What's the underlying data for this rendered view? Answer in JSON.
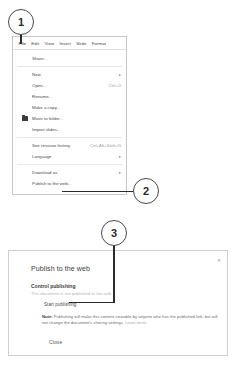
{
  "callouts": [
    {
      "number": "1",
      "target": "file-menu"
    },
    {
      "number": "2",
      "target": "publish-to-the-web-menu-item"
    },
    {
      "number": "3",
      "target": "start-publishing-button"
    }
  ],
  "menu_bar": {
    "items": [
      {
        "label": "File",
        "active": true
      },
      {
        "label": "Edit",
        "active": false
      },
      {
        "label": "View",
        "active": false
      },
      {
        "label": "Insert",
        "active": false
      },
      {
        "label": "Slide",
        "active": false
      },
      {
        "label": "Format",
        "active": false
      }
    ]
  },
  "file_menu": {
    "groups": [
      {
        "items": [
          {
            "label": "Share...",
            "shortcut": "",
            "arrow": "",
            "icon": ""
          }
        ]
      },
      {
        "items": [
          {
            "label": "New",
            "shortcut": "",
            "arrow": "▸",
            "icon": ""
          },
          {
            "label": "Open...",
            "shortcut": "Ctrl+O",
            "arrow": "",
            "icon": ""
          },
          {
            "label": "Rename...",
            "shortcut": "",
            "arrow": "",
            "icon": ""
          },
          {
            "label": "Make a copy...",
            "shortcut": "",
            "arrow": "",
            "icon": ""
          },
          {
            "label": "Move to folder...",
            "shortcut": "",
            "arrow": "",
            "icon": "folder-icon"
          },
          {
            "label": "Import slides...",
            "shortcut": "",
            "arrow": "",
            "icon": ""
          }
        ]
      },
      {
        "items": [
          {
            "label": "See revision history",
            "shortcut": "Ctrl+Alt+Shift+G",
            "arrow": "",
            "icon": ""
          },
          {
            "label": "Language",
            "shortcut": "",
            "arrow": "▸",
            "icon": ""
          }
        ]
      },
      {
        "items": [
          {
            "label": "Download as",
            "shortcut": "",
            "arrow": "▸",
            "icon": ""
          },
          {
            "label": "Publish to the web...",
            "shortcut": "",
            "arrow": "",
            "icon": ""
          }
        ]
      }
    ]
  },
  "dialog": {
    "title": "Publish to the web",
    "close_icon": "✕",
    "section_title": "Control publishing",
    "section_subtitle": "This document is not published to the web.",
    "start_publishing_label": "Start publishing",
    "note_prefix": "Note:",
    "note_text": " Publishing will make this content viewable by anyone who has the published link, but will not change the document's sharing settings. ",
    "note_link": "Learn more",
    "close_label": "Close"
  }
}
